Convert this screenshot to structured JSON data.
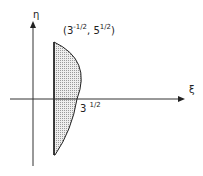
{
  "diagram": {
    "axes": {
      "vertical_label": "η",
      "horizontal_label": "ξ"
    },
    "point_label": {
      "open": "(",
      "base1": "3",
      "exp1": "-1/2",
      "sep": ", ",
      "base2": "5",
      "exp2": "1/2",
      "close": ")"
    },
    "intercept_label": {
      "base": "3",
      "exp": "1/2"
    },
    "region": {
      "description": "shaded region bounded by vertical line and arc",
      "fill": "#d8d8d8",
      "stroke": "#222222"
    }
  }
}
